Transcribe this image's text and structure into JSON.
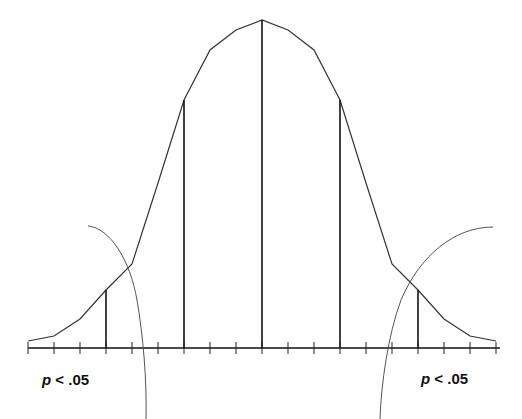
{
  "diagram": {
    "title": "",
    "colors": {
      "curve": "#333333",
      "axis": "#111111",
      "arcs": "#555555",
      "background": "#ffffff"
    },
    "axis": {
      "y": 348,
      "x_start": 28,
      "x_end": 500,
      "tick_spacing": 26,
      "tick_count": 19
    },
    "curve_points": [
      [
        28,
        341
      ],
      [
        54,
        336
      ],
      [
        80,
        319
      ],
      [
        106,
        290
      ],
      [
        132,
        264
      ],
      [
        158,
        183
      ],
      [
        184,
        100
      ],
      [
        210,
        50
      ],
      [
        236,
        30
      ],
      [
        262,
        20
      ],
      [
        288,
        30
      ],
      [
        314,
        50
      ],
      [
        340,
        100
      ],
      [
        366,
        183
      ],
      [
        392,
        264
      ],
      [
        418,
        290
      ],
      [
        444,
        319
      ],
      [
        470,
        336
      ],
      [
        496,
        341
      ]
    ],
    "vertical_lines": [
      {
        "x": 106,
        "top": 290
      },
      {
        "x": 184,
        "top": 100
      },
      {
        "x": 262,
        "top": 20
      },
      {
        "x": 340,
        "top": 100
      },
      {
        "x": 418,
        "top": 290
      }
    ],
    "labels": {
      "left": {
        "p": "p",
        "rest": " < .05"
      },
      "right": {
        "p": "p",
        "rest": " < .05"
      }
    }
  }
}
